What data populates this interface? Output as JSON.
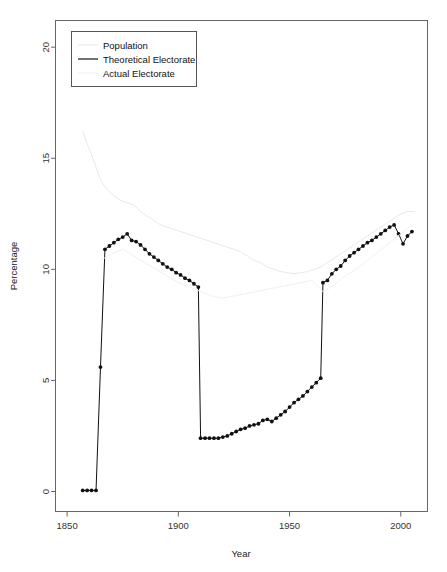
{
  "chart_data": {
    "type": "line",
    "title": "",
    "xlabel": "Year",
    "ylabel": "Percentage",
    "xlim": [
      1845,
      2012
    ],
    "ylim": [
      -0.9,
      21.2
    ],
    "xticks": [
      1850,
      1900,
      1950,
      2000
    ],
    "yticks": [
      0,
      5,
      10,
      15,
      20
    ],
    "grid": false,
    "legend_position": "top-left",
    "legend": [
      "Population",
      "Theoretical Electorate",
      "Actual Electorate"
    ],
    "series": [
      {
        "name": "Population",
        "color": "#e9e9e9",
        "style": "line",
        "x": [
          1857,
          1860,
          1863,
          1865,
          1868,
          1871,
          1874,
          1877,
          1880,
          1883,
          1886,
          1889,
          1892,
          1895,
          1898,
          1901,
          1904,
          1907,
          1910,
          1913,
          1916,
          1919,
          1922,
          1925,
          1928,
          1931,
          1934,
          1937,
          1940,
          1943,
          1946,
          1949,
          1952,
          1955,
          1958,
          1961,
          1964,
          1967,
          1970,
          1973,
          1976,
          1979,
          1982,
          1985,
          1988,
          1991,
          1994,
          1997,
          2000,
          2003,
          2006
        ],
        "values": [
          16.2,
          15.4,
          14.6,
          14.0,
          13.6,
          13.3,
          13.1,
          13.0,
          12.9,
          12.6,
          12.4,
          12.2,
          12.0,
          11.9,
          11.8,
          11.7,
          11.6,
          11.5,
          11.4,
          11.3,
          11.2,
          11.1,
          11.0,
          10.9,
          10.8,
          10.6,
          10.4,
          10.3,
          10.1,
          10.0,
          9.9,
          9.85,
          9.8,
          9.85,
          9.9,
          10.0,
          10.1,
          10.3,
          10.5,
          10.7,
          10.9,
          11.1,
          11.3,
          11.5,
          11.7,
          11.9,
          12.1,
          12.3,
          12.5,
          12.6,
          12.6
        ]
      },
      {
        "name": "Theoretical Electorate",
        "color": "#111111",
        "style": "line-points",
        "x": [
          1857,
          1859,
          1861,
          1863,
          1865,
          1867,
          1869,
          1871,
          1873,
          1875,
          1877,
          1879,
          1881,
          1883,
          1885,
          1887,
          1889,
          1891,
          1893,
          1895,
          1897,
          1899,
          1901,
          1903,
          1905,
          1907,
          1909,
          1910,
          1912,
          1914,
          1916,
          1918,
          1920,
          1922,
          1924,
          1926,
          1928,
          1930,
          1932,
          1934,
          1936,
          1938,
          1940,
          1942,
          1944,
          1946,
          1948,
          1950,
          1952,
          1954,
          1956,
          1958,
          1960,
          1962,
          1964,
          1965,
          1967,
          1969,
          1971,
          1973,
          1975,
          1977,
          1979,
          1981,
          1983,
          1985,
          1987,
          1989,
          1991,
          1993,
          1995,
          1997,
          1999,
          2001,
          2003,
          2005
        ],
        "values": [
          0.05,
          0.05,
          0.05,
          0.05,
          5.6,
          10.9,
          11.05,
          11.2,
          11.35,
          11.45,
          11.6,
          11.3,
          11.25,
          11.1,
          10.9,
          10.7,
          10.55,
          10.4,
          10.25,
          10.1,
          10.0,
          9.85,
          9.75,
          9.6,
          9.5,
          9.35,
          9.2,
          2.4,
          2.4,
          2.4,
          2.4,
          2.4,
          2.45,
          2.5,
          2.6,
          2.7,
          2.8,
          2.85,
          2.95,
          3.0,
          3.05,
          3.2,
          3.25,
          3.15,
          3.3,
          3.45,
          3.6,
          3.8,
          4.0,
          4.15,
          4.3,
          4.5,
          4.7,
          4.9,
          5.1,
          9.4,
          9.5,
          9.8,
          10.0,
          10.15,
          10.4,
          10.6,
          10.75,
          10.9,
          11.05,
          11.2,
          11.3,
          11.45,
          11.6,
          11.75,
          11.9,
          12.0,
          11.6,
          11.15,
          11.5,
          11.7
        ]
      },
      {
        "name": "Actual Electorate",
        "color": "#f0f0f0",
        "style": "line",
        "x": [
          1865,
          1870,
          1875,
          1880,
          1885,
          1890,
          1895,
          1900,
          1905,
          1910,
          1915,
          1920,
          1925,
          1930,
          1935,
          1940,
          1945,
          1950,
          1955,
          1960,
          1965,
          1970,
          1975,
          1980,
          1985,
          1990,
          1995,
          2000,
          2005
        ],
        "values": [
          10.4,
          10.7,
          10.9,
          10.6,
          10.3,
          10.0,
          9.7,
          9.4,
          9.2,
          9.0,
          8.8,
          8.7,
          8.8,
          8.9,
          9.0,
          9.1,
          9.2,
          9.3,
          9.4,
          9.5,
          9.0,
          9.3,
          9.7,
          10.0,
          10.4,
          10.8,
          11.2,
          11.6,
          12.0
        ]
      }
    ]
  },
  "axes": {
    "ylabel": "Percentage",
    "xlabel": "Year",
    "ytick_labels": [
      "0",
      "5",
      "10",
      "15",
      "20"
    ],
    "xtick_labels": [
      "1850",
      "1900",
      "1950",
      "2000"
    ]
  },
  "legend": {
    "items": [
      {
        "label": "Population",
        "color": "#e9e9e9"
      },
      {
        "label": "Theoretical Electorate",
        "color": "#111111"
      },
      {
        "label": "Actual Electorate",
        "color": "#f0f0f0"
      }
    ]
  }
}
